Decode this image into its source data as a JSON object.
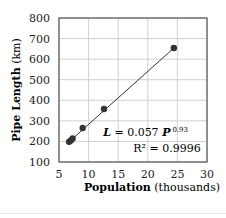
{
  "chart_data": {
    "type": "scatter",
    "title": "",
    "xlabel": {
      "bold": "Population",
      "normal": " (thousands)"
    },
    "ylabel": {
      "bold": "Pipe Length",
      "normal": " (km)"
    },
    "xlim": [
      5,
      30
    ],
    "ylim": [
      100,
      800
    ],
    "xticks": [
      5,
      10,
      15,
      20,
      25,
      30
    ],
    "yticks": [
      100,
      200,
      300,
      400,
      500,
      600,
      700,
      800
    ],
    "grid": true,
    "legend": null,
    "series": [
      {
        "name": "Observed",
        "marker": "circle",
        "color": "#333333",
        "points": [
          {
            "x": 6.7,
            "y": 198
          },
          {
            "x": 7.0,
            "y": 205
          },
          {
            "x": 7.3,
            "y": 214
          },
          {
            "x": 9.0,
            "y": 265
          },
          {
            "x": 12.6,
            "y": 358
          },
          {
            "x": 24.4,
            "y": 654
          }
        ]
      },
      {
        "name": "Power fit",
        "type": "line",
        "color": "#333333",
        "x": [
          6.7,
          24.4
        ],
        "y": [
          198,
          654
        ]
      }
    ],
    "annotations": [
      {
        "text_lines": [
          "L = 0.057 P^0.93",
          "R² = 0.9996"
        ],
        "position": "lower-right"
      }
    ]
  },
  "annotation": {
    "equation_L": "L",
    "equation_mid": " = 0.057 ",
    "equation_P": "P",
    "equation_exp": "0.93",
    "r_squared": "R² = 0.9996"
  },
  "axes": {
    "x_tick_labels": [
      "5",
      "10",
      "15",
      "20",
      "25",
      "30"
    ],
    "y_tick_labels": [
      "100",
      "200",
      "300",
      "400",
      "500",
      "600",
      "700",
      "800"
    ],
    "x_label_bold": "Population",
    "x_label_normal": " (thousands)",
    "y_label_bold": "Pipe Length",
    "y_label_normal": " (km)"
  },
  "colors": {
    "grid": "#d0d0d0",
    "frame": "#555555",
    "marker": "#333333",
    "text": "#222222"
  }
}
